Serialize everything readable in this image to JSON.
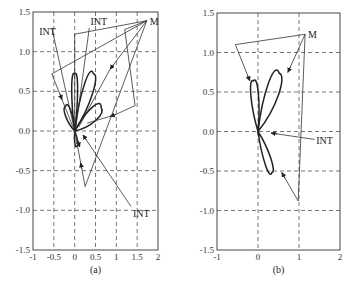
{
  "figure": {
    "panels": [
      {
        "id": "a",
        "caption": "(a)",
        "xlim": [
          -1,
          2
        ],
        "ylim": [
          -1.5,
          1.5
        ],
        "xticks": [
          -1,
          -0.5,
          0,
          0.5,
          1,
          1.5,
          2
        ],
        "xtick_labels": [
          "-1",
          "-0.5",
          "0",
          "0.5",
          "1",
          "1.5",
          "2"
        ],
        "yticks": [
          -1.5,
          -1.0,
          -0.5,
          0.0,
          0.5,
          1.0,
          1.5
        ],
        "ytick_labels": [
          "-1.5",
          "-1.0",
          "-0.5",
          "0.0",
          "0.5",
          "1.0",
          "1.5"
        ],
        "grid": "dashed",
        "labels": [
          {
            "text": "M",
            "x": 1.8,
            "y": 1.37
          },
          {
            "text": "INT",
            "x": -0.85,
            "y": 1.25
          },
          {
            "text": "INT",
            "x": 0.38,
            "y": 1.37
          },
          {
            "text": "INT",
            "x": 1.4,
            "y": -1.05
          }
        ],
        "polylines": [
          {
            "name": "left-trajectory",
            "points": [
              [
                1.73,
                1.39
              ],
              [
                -0.55,
                0.72
              ],
              [
                -0.04,
                0.05
              ]
            ],
            "arrow_at": [
              -0.3,
              0.4
            ]
          },
          {
            "name": "int-left-line",
            "points": [
              [
                -0.55,
                1.3
              ],
              [
                -0.02,
                0.05
              ]
            ],
            "arrow_at": null
          },
          {
            "name": "int-top-line",
            "points": [
              [
                0.35,
                1.3
              ],
              [
                0.03,
                0.05
              ]
            ],
            "arrow_at": null
          },
          {
            "name": "upper-box",
            "points": [
              [
                1.73,
                1.39
              ],
              [
                0.0,
                1.22
              ],
              [
                0.0,
                0.1
              ]
            ],
            "arrow_at": null
          },
          {
            "name": "right-box",
            "points": [
              [
                1.73,
                1.39
              ],
              [
                1.2,
                1.28
              ],
              [
                1.45,
                0.32
              ],
              [
                0.95,
                0.2
              ],
              [
                0.3,
                0.1
              ]
            ],
            "arrow_at": [
              0.85,
              0.2
            ]
          },
          {
            "name": "m-diagonal",
            "points": [
              [
                1.73,
                1.39
              ],
              [
                0.85,
                0.78
              ],
              [
                0.1,
                0.05
              ]
            ],
            "arrow_at": [
              0.85,
              0.78
            ]
          },
          {
            "name": "lower-vee",
            "points": [
              [
                1.73,
                1.39
              ],
              [
                0.25,
                -0.7
              ],
              [
                0.0,
                0.0
              ]
            ],
            "arrow_at": [
              0.15,
              -0.4
            ]
          },
          {
            "name": "int-bottom-line",
            "points": [
              [
                1.35,
                -0.95
              ],
              [
                0.2,
                -0.05
              ]
            ],
            "arrow_at": [
              0.2,
              -0.05
            ]
          },
          {
            "name": "lower-short",
            "points": [
              [
                0.0,
                0.0
              ],
              [
                0.12,
                -0.2
              ]
            ],
            "arrow_at": [
              0.12,
              -0.2
            ]
          }
        ],
        "lobes": [
          {
            "angle_deg": 90,
            "length": 0.72,
            "width": 0.1
          },
          {
            "angle_deg": 58,
            "length": 0.85,
            "width": 0.16
          },
          {
            "angle_deg": 25,
            "length": 0.7,
            "width": 0.13
          },
          {
            "angle_deg": 125,
            "length": 0.38,
            "width": 0.1
          },
          {
            "angle_deg": -75,
            "length": 0.2,
            "width": 0.05
          }
        ]
      },
      {
        "id": "b",
        "caption": "(b)",
        "xlim": [
          -1,
          2
        ],
        "ylim": [
          -1.5,
          1.5
        ],
        "xticks": [
          -1,
          0,
          1,
          2
        ],
        "xtick_labels": [
          "-1",
          "0",
          "1",
          "2"
        ],
        "yticks": [
          -1.5,
          -1.0,
          -0.5,
          0.0,
          0.5,
          1.0,
          1.5
        ],
        "ytick_labels": [
          "-1.5",
          "-1.0",
          "-0.5",
          "0.0",
          "0.5",
          "1.0",
          "1.5"
        ],
        "grid": "dashed",
        "labels": [
          {
            "text": "M",
            "x": 1.22,
            "y": 1.22
          },
          {
            "text": "INT",
            "x": 1.42,
            "y": -0.12
          }
        ],
        "polylines": [
          {
            "name": "left-trajectory",
            "points": [
              [
                1.15,
                1.23
              ],
              [
                -0.55,
                1.1
              ],
              [
                -0.2,
                0.64
              ]
            ],
            "arrow_at": [
              -0.2,
              0.64
            ]
          },
          {
            "name": "m-to-lobe",
            "points": [
              [
                1.15,
                1.23
              ],
              [
                0.73,
                0.75
              ]
            ],
            "arrow_at": [
              0.73,
              0.75
            ]
          },
          {
            "name": "right-vertical",
            "points": [
              [
                1.15,
                1.23
              ],
              [
                0.98,
                -0.88
              ]
            ],
            "arrow_at": null
          },
          {
            "name": "lower-return",
            "points": [
              [
                0.98,
                -0.88
              ],
              [
                0.58,
                -0.52
              ]
            ],
            "arrow_at": [
              0.58,
              -0.52
            ]
          },
          {
            "name": "int-line",
            "points": [
              [
                1.38,
                -0.1
              ],
              [
                0.32,
                -0.02
              ]
            ],
            "arrow_at": [
              0.32,
              -0.02
            ]
          }
        ],
        "lobes": [
          {
            "angle_deg": 100,
            "length": 0.65,
            "width": 0.13
          },
          {
            "angle_deg": 55,
            "length": 0.9,
            "width": 0.2
          },
          {
            "angle_deg": -57,
            "length": 0.62,
            "width": 0.11
          }
        ]
      }
    ]
  }
}
